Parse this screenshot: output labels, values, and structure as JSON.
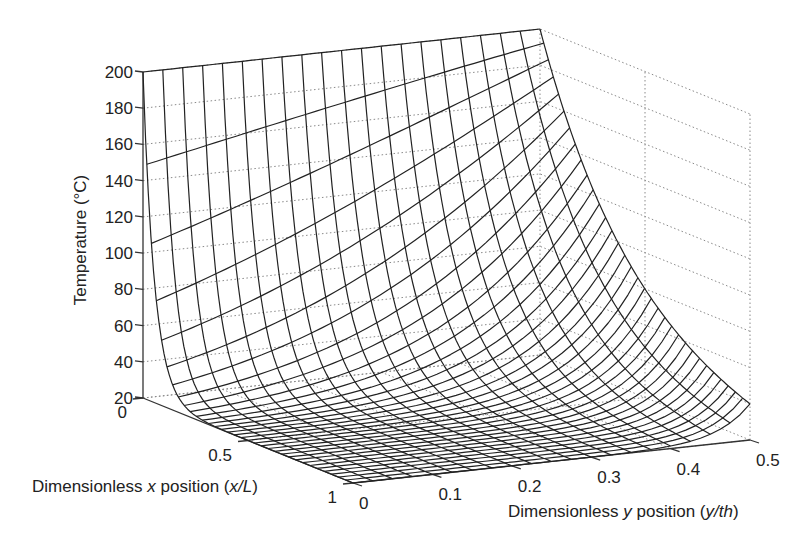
{
  "chart_data": {
    "type": "surface",
    "title": "",
    "xlabel": "Dimensionless x position (x/L)",
    "ylabel": "Dimensionless y position (y/th)",
    "zlabel": "Temperature (°C)",
    "xlabel_parts": [
      "Dimensionless ",
      "x",
      " position (",
      "x/L",
      ")"
    ],
    "ylabel_parts": [
      "Dimensionless ",
      "y",
      " position (",
      "y/th",
      ")"
    ],
    "x_ticks": [
      "0",
      "0.5",
      "1"
    ],
    "y_ticks": [
      "0",
      "0.1",
      "0.2",
      "0.3",
      "0.4",
      "0.5"
    ],
    "z_ticks": [
      "20",
      "40",
      "60",
      "80",
      "100",
      "120",
      "140",
      "160",
      "180",
      "200"
    ],
    "xlim": [
      0,
      1
    ],
    "ylim": [
      0,
      0.5
    ],
    "zlim": [
      20,
      200
    ],
    "grid": true,
    "legend": null,
    "surface_description": "Temperature is 200 °C along the base edge x=0 for all y, decays steeply with x toward ~20 °C at x=1; decay is fastest near y=0 and slower toward y=0.5 (insulated edge).",
    "mesh_x_count": 21,
    "mesh_y_count": 21,
    "sample_profile_y0": {
      "x": [
        0,
        0.05,
        0.1,
        0.2,
        0.3,
        0.5,
        0.7,
        1.0
      ],
      "T": [
        200,
        140,
        105,
        65,
        45,
        28,
        22,
        20
      ]
    },
    "sample_profile_y05": {
      "x": [
        0,
        0.05,
        0.1,
        0.2,
        0.3,
        0.5,
        0.7,
        1.0
      ],
      "T": [
        200,
        185,
        170,
        140,
        115,
        80,
        55,
        30
      ]
    }
  }
}
